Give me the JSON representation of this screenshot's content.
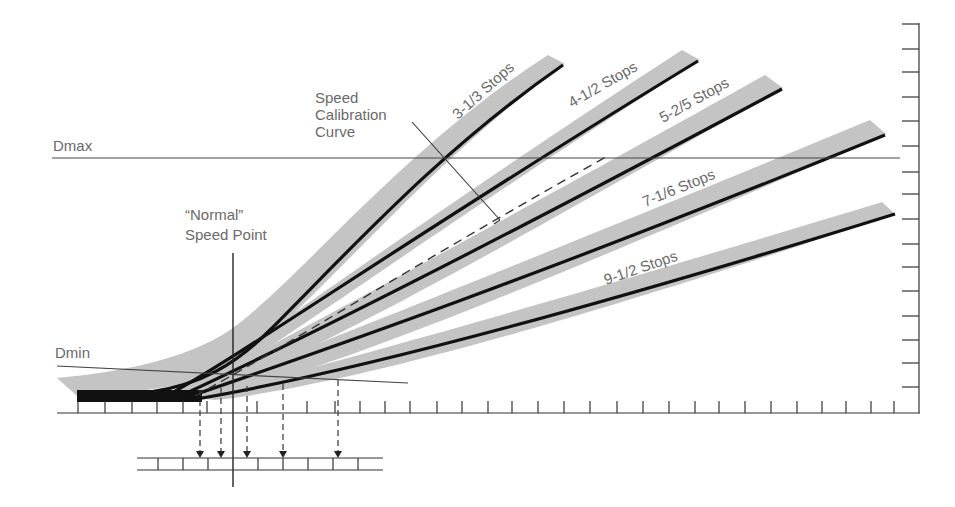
{
  "diagram": {
    "type": "characteristic-curve-speed-calibration",
    "labels": {
      "dmax": "Dmax",
      "dmin": "Dmin",
      "speed_point_line1": "“Normal”",
      "speed_point_line2": "Speed Point",
      "calibration_line1": "Speed",
      "calibration_line2": "Calibration",
      "calibration_line3": "Curve"
    },
    "curves": [
      {
        "id": "c1",
        "label": "3-1/3 Stops"
      },
      {
        "id": "c2",
        "label": "4-1/2 Stops"
      },
      {
        "id": "c3",
        "label": "5-2/5 Stops"
      },
      {
        "id": "c4",
        "label": "7-1/6 Stops"
      },
      {
        "id": "c5",
        "label": "9-1/2 Stops"
      }
    ],
    "colors": {
      "band": "#c4c4c4",
      "curve": "#111111",
      "axis": "#444444",
      "text": "#6a6a6a"
    }
  }
}
